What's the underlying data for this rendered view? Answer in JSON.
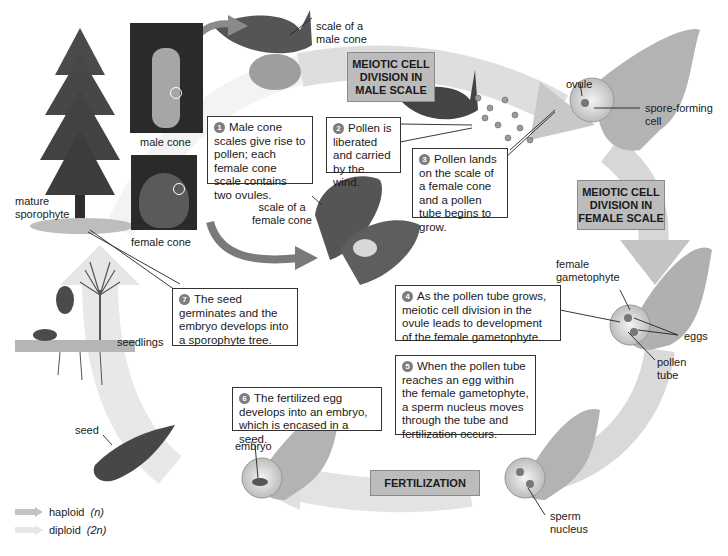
{
  "colors": {
    "haploid_arrow": "#c4c4c4",
    "diploid_arrow": "#e6e6e6",
    "stage_box": "#bcbcbc",
    "step_badge": "#7d7d7d"
  },
  "labels": {
    "scale_male_cone": "scale of a male cone",
    "male_cone": "male cone",
    "female_cone": "female cone",
    "scale_female_cone": "scale of a female cone",
    "mature_sporophyte": "mature sporophyte",
    "ovule": "ovule",
    "spore_forming_cell": "spore-forming cell",
    "female_gametophyte": "female gametophyte",
    "eggs": "eggs",
    "pollen_tube": "pollen tube",
    "sperm_nucleus": "sperm nucleus",
    "embryo": "embryo",
    "seed": "seed",
    "seedlings": "seedlings"
  },
  "stages": {
    "meiosis_male": "MEIOTIC CELL DIVISION IN MALE SCALE",
    "meiosis_female": "MEIOTIC CELL DIVISION IN FEMALE SCALE",
    "fertilization": "FERTILIZATION"
  },
  "steps": [
    {
      "n": "1",
      "text": "Male cone scales give rise to pollen; each female cone scale contains two ovules."
    },
    {
      "n": "2",
      "text": "Pollen is liberated and carried by the wind."
    },
    {
      "n": "3",
      "text": "Pollen lands on the scale of a female cone and a pollen tube begins to grow."
    },
    {
      "n": "4",
      "text": "As the pollen tube grows, meiotic cell division in the ovule leads to development of the female gametophyte."
    },
    {
      "n": "5",
      "text": "When the pollen tube reaches an egg within the female gametophyte, a sperm nucleus moves through the tube and fertilization occurs."
    },
    {
      "n": "6",
      "text": "The fertilized egg develops into an embryo, which is encased in a seed."
    },
    {
      "n": "7",
      "text": "The seed germinates and the embryo develops into a sporophyte tree."
    }
  ],
  "legend": [
    {
      "label": "haploid",
      "suffix": "(n)"
    },
    {
      "label": "diploid",
      "suffix": "(2n)"
    }
  ]
}
